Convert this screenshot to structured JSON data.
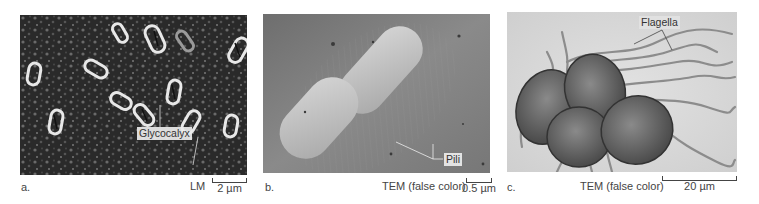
{
  "figure": {
    "panels": [
      {
        "letter": "a.",
        "technique": "LM",
        "scale_bar": "2 µm",
        "callout": "Glycocalyx"
      },
      {
        "letter": "b.",
        "technique": "TEM (false color)",
        "scale_bar": "0.5 µm",
        "callout": "Pili"
      },
      {
        "letter": "c.",
        "technique": "TEM (false color)",
        "scale_bar": "20 µm",
        "callout": "Flagella"
      }
    ],
    "colors": {
      "panel_a_bg": "#2b2b2b",
      "panel_b_bg": "#7a7a7a",
      "panel_c_bg": "#dcdcdc",
      "label_text": "#444444"
    }
  }
}
